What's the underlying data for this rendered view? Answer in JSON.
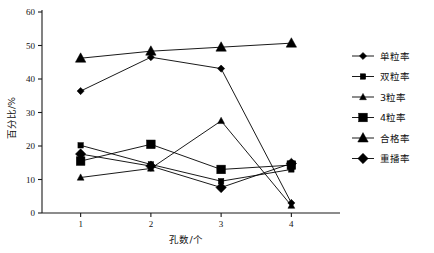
{
  "chart_data": {
    "type": "line",
    "title": "",
    "xlabel": "孔数/个",
    "ylabel": "百分比/%",
    "x": [
      1,
      2,
      3,
      4
    ],
    "categories": [
      "1",
      "2",
      "3",
      "4"
    ],
    "xtick_labels": [
      "1",
      "2",
      "3",
      "4"
    ],
    "ytick_labels": [
      "0",
      "10",
      "20",
      "30",
      "40",
      "50",
      "60"
    ],
    "yticks": [
      0,
      10,
      20,
      30,
      40,
      50,
      60
    ],
    "ylim": [
      0,
      60
    ],
    "xlim": [
      0.45,
      4.55
    ],
    "grid": false,
    "legend_position": "right",
    "series": [
      {
        "name": "单粒率",
        "marker": "diamond-small",
        "values": [
          36.4,
          46.5,
          43.1,
          3.0
        ]
      },
      {
        "name": "双粒率",
        "marker": "square-small",
        "values": [
          20.2,
          14.5,
          9.5,
          13.0
        ]
      },
      {
        "name": "3粒率",
        "marker": "triangle-small",
        "values": [
          10.6,
          13.3,
          27.5,
          2.2
        ]
      },
      {
        "name": "4粒率",
        "marker": "square-large",
        "values": [
          15.5,
          20.5,
          13.0,
          14.3
        ]
      },
      {
        "name": "合格率",
        "marker": "triangle-large",
        "values": [
          46.2,
          48.3,
          49.5,
          50.7
        ]
      },
      {
        "name": "重播率",
        "marker": "diamond-large",
        "values": [
          17.6,
          14.0,
          7.6,
          14.8
        ]
      }
    ]
  },
  "legend": {
    "items": [
      {
        "label": "单粒率",
        "marker": "diamond-small"
      },
      {
        "label": "双粒率",
        "marker": "square-small"
      },
      {
        "label": "3粒率",
        "marker": "triangle-small"
      },
      {
        "label": "4粒率",
        "marker": "square-large"
      },
      {
        "label": "合格率",
        "marker": "triangle-large"
      },
      {
        "label": "重播率",
        "marker": "diamond-large"
      }
    ]
  },
  "colors": {
    "series": "#000000",
    "axis": "#1a1a1a",
    "background": "#ffffff"
  }
}
